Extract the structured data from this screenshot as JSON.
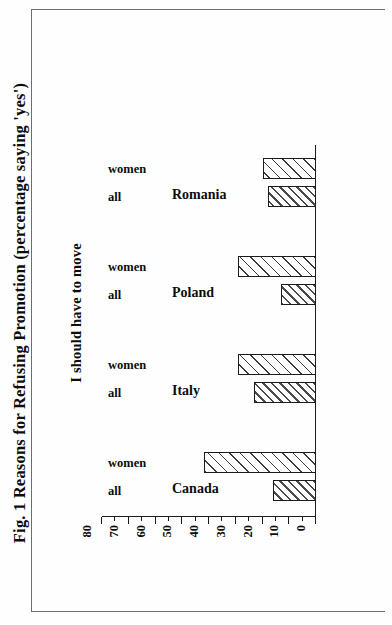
{
  "figure": {
    "title": "Fig. 1 Reasons for Refusing Promotion (percentage saying 'yes')",
    "subtitle": "I should have to move"
  },
  "chart_data": {
    "type": "bar",
    "title": "Fig. 1 Reasons for Refusing Promotion (percentage saying 'yes')",
    "subtitle": "I should have to move",
    "xlabel": "",
    "ylabel": "",
    "ylim": [
      0,
      80
    ],
    "yticks": [
      0,
      10,
      20,
      30,
      40,
      50,
      60,
      70,
      80
    ],
    "ytick_labels": [
      "0",
      "10",
      "20",
      "30",
      "40",
      "50",
      "60",
      "70",
      "80"
    ],
    "minor_tick_step": 5,
    "grid": false,
    "legend": "none",
    "orientation": "rotated-90-ccw",
    "categories": [
      "Canada",
      "Italy",
      "Poland",
      "Romania"
    ],
    "series": [
      {
        "name": "all",
        "values": [
          16,
          23,
          13,
          18
        ]
      },
      {
        "name": "women",
        "values": [
          42,
          29,
          29,
          20
        ]
      }
    ]
  },
  "ticks": [
    {
      "value": 0,
      "label": "0"
    },
    {
      "value": 10,
      "label": "10"
    },
    {
      "value": 20,
      "label": "20"
    },
    {
      "value": 30,
      "label": "30"
    },
    {
      "value": 40,
      "label": "40"
    },
    {
      "value": 50,
      "label": "50"
    },
    {
      "value": 60,
      "label": "60"
    },
    {
      "value": 70,
      "label": "70"
    },
    {
      "value": 80,
      "label": "80"
    }
  ],
  "groups": [
    {
      "category": "Canada",
      "bars": [
        {
          "series": "all",
          "value": 16
        },
        {
          "series": "women",
          "value": 42
        }
      ]
    },
    {
      "category": "Italy",
      "bars": [
        {
          "series": "all",
          "value": 23
        },
        {
          "series": "women",
          "value": 29
        }
      ]
    },
    {
      "category": "Poland",
      "bars": [
        {
          "series": "all",
          "value": 13
        },
        {
          "series": "women",
          "value": 29
        }
      ]
    },
    {
      "category": "Romania",
      "bars": [
        {
          "series": "all",
          "value": 18
        },
        {
          "series": "women",
          "value": 20
        }
      ]
    }
  ],
  "colors": {
    "ink": "#0d0d0d",
    "axis": "#1b1b1b",
    "frame": "#6e6e6e",
    "paper": "#fefefe",
    "hatch": "#3a3a3a"
  }
}
